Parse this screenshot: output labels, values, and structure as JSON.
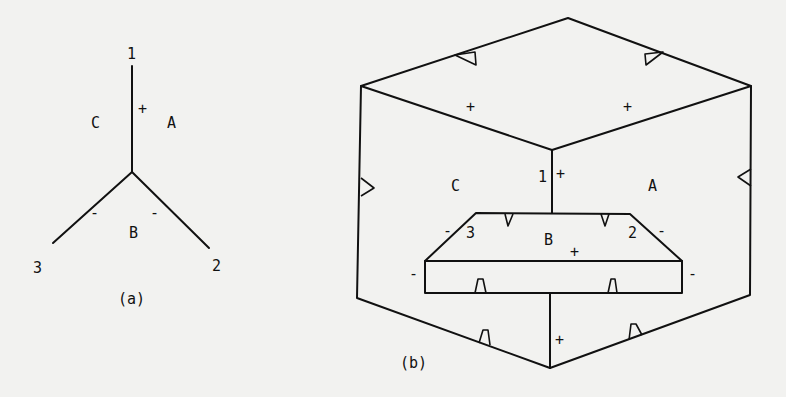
{
  "figure_a": {
    "caption": "(a)",
    "vertex_labels": {
      "v1": "1",
      "v2": "2",
      "v3": "3"
    },
    "region_labels": {
      "A": "A",
      "B": "B",
      "C": "C"
    },
    "edge_signs": {
      "edge_1": "+",
      "edge_2": "-",
      "edge_3": "-"
    }
  },
  "figure_b": {
    "caption": "(b)",
    "vertex_labels": {
      "v1": "1",
      "v2": "2",
      "v3": "3"
    },
    "region_labels": {
      "A": "A",
      "B": "B",
      "C": "C"
    },
    "signs": {
      "top_left_face": "+",
      "top_right_face": "+",
      "center_edge_top": "+",
      "region_b": "+",
      "left_slant": "-",
      "right_slant": "-",
      "rect_left": "-",
      "rect_right": "-",
      "center_edge_bottom": "+"
    }
  }
}
